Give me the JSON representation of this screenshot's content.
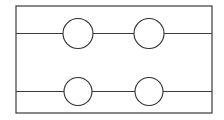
{
  "canvas": {
    "width": 224,
    "height": 120,
    "background": "#ffffff"
  },
  "style": {
    "stroke_color": "#3a3a3a",
    "circle_stroke_color": "#2e2e2e",
    "circle_fill": "#ffffff",
    "frame_stroke_width": 1.2,
    "line_stroke_width": 1.2,
    "circle_stroke_width": 1.1
  },
  "diagram": {
    "type": "line-diagram",
    "frame": {
      "label": "outer-rectangle",
      "x": 16,
      "y": 6,
      "width": 196,
      "height": 107
    },
    "horizontal_lines": [
      {
        "label": "upper-rule",
        "y": 33.5,
        "x1": 16,
        "x2": 212
      },
      {
        "label": "lower-rule",
        "y": 91.5,
        "x1": 16,
        "x2": 212
      }
    ],
    "circles": [
      {
        "label": "top-left-node",
        "cx": 78,
        "cy": 33.5,
        "r": 15
      },
      {
        "label": "top-right-node",
        "cx": 149,
        "cy": 33.5,
        "r": 15
      },
      {
        "label": "bottom-left-node",
        "cx": 78,
        "cy": 91.5,
        "r": 14
      },
      {
        "label": "bottom-right-node",
        "cx": 149,
        "cy": 91.5,
        "r": 14
      }
    ]
  }
}
